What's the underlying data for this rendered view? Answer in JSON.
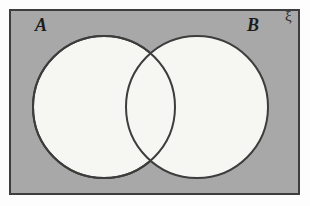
{
  "figure": {
    "type": "venn-diagram",
    "width": 310,
    "height": 206
  },
  "labels": {
    "set_a": "A",
    "set_b": "B",
    "universal_set": "ξ"
  },
  "colors": {
    "page_background": "#fdfdfd",
    "universe_fill": "#a8a8a8",
    "universe_stroke": "#3d3d3d",
    "circle_fill": "#f6f6f3",
    "circle_stroke": "#3d3d3d"
  },
  "geometry": {
    "universe_rect": {
      "x": 9,
      "y": 9,
      "width": 291,
      "height": 186,
      "stroke_width": 2
    },
    "circle_a": {
      "cx": 104,
      "cy": 107,
      "r": 71,
      "stroke_width": 2
    },
    "circle_b": {
      "cx": 197,
      "cy": 107,
      "r": 71,
      "stroke_width": 2
    }
  },
  "regions": {
    "intersection_shaded": false,
    "a_only_shaded": false,
    "b_only_shaded": false,
    "outside_shaded": true
  }
}
